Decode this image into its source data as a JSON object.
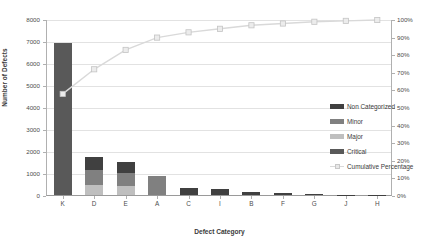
{
  "chart_data": {
    "type": "bar",
    "title": "",
    "subtitle": "",
    "xlabel": "Defect Category",
    "ylabel": "Number of Defects",
    "y2label": "",
    "categories": [
      "K",
      "D",
      "E",
      "A",
      "C",
      "I",
      "B",
      "F",
      "G",
      "J",
      "H"
    ],
    "ylim": [
      0,
      8000
    ],
    "y_ticks": [
      0,
      1000,
      2000,
      3000,
      4000,
      5000,
      6000,
      7000,
      8000
    ],
    "y_tick_labels": [
      "0",
      "1000",
      "2000",
      "3000",
      "4000",
      "5000",
      "6000",
      "7000",
      "8000"
    ],
    "y2lim": [
      0,
      100
    ],
    "y2_ticks": [
      0,
      10,
      20,
      30,
      40,
      50,
      60,
      70,
      80,
      90,
      100
    ],
    "y2_tick_labels": [
      "0%",
      "10%",
      "20%",
      "30%",
      "40%",
      "50%",
      "60%",
      "70%",
      "80%",
      "90%",
      "100%"
    ],
    "grid": true,
    "legend_position": "inside-right",
    "stacked": true,
    "series": [
      {
        "name": "Critical",
        "color": "#595959",
        "values": [
          6900,
          0,
          0,
          0,
          0,
          0,
          0,
          0,
          0,
          0,
          0
        ]
      },
      {
        "name": "Non Categorized",
        "color": "#404040",
        "values": [
          0,
          600,
          500,
          0,
          330,
          260,
          130,
          110,
          45,
          20,
          15
        ]
      },
      {
        "name": "Minor",
        "color": "#808080",
        "values": [
          0,
          700,
          600,
          850,
          0,
          0,
          0,
          0,
          0,
          0,
          0
        ]
      },
      {
        "name": "Major",
        "color": "#bfbfbf",
        "values": [
          0,
          450,
          400,
          0,
          0,
          0,
          0,
          0,
          0,
          0,
          0
        ]
      }
    ],
    "bar_totals": [
      6900,
      1750,
      1500,
      850,
      330,
      260,
      130,
      110,
      45,
      20,
      15
    ],
    "cumulative_line": {
      "name": "Cumulative Percentage",
      "color": "#d9d9d9",
      "marker_fill": "#ececec",
      "marker_edge": "#c4c4c4",
      "values": [
        58,
        72,
        83,
        90,
        93,
        95,
        97,
        98,
        99,
        99.5,
        100
      ]
    }
  },
  "legend": {
    "items": [
      {
        "label": "Non Categorized",
        "color": "#404040",
        "kind": "swatch"
      },
      {
        "label": "Minor",
        "color": "#808080",
        "kind": "swatch"
      },
      {
        "label": "Major",
        "color": "#bfbfbf",
        "kind": "swatch"
      },
      {
        "label": "Critical",
        "color": "#595959",
        "kind": "swatch"
      },
      {
        "label": "Cumulative Percentage",
        "color": "#d9d9d9",
        "kind": "line"
      }
    ]
  },
  "colors": {
    "plot_background": "#ffffff",
    "gridline": "#e2e2e2",
    "axis": "#b0b0b0",
    "text": "#4d4d4d"
  }
}
